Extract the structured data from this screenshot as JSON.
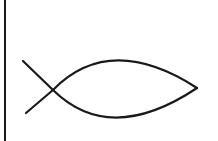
{
  "figure": {
    "subject": "ichthys fish symbol",
    "stroke_color": "#1a1a1a",
    "background_color": "#ffffff",
    "border_line": "left vertical rule"
  }
}
